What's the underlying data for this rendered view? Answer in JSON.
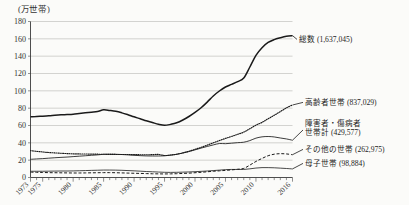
{
  "chart_data": {
    "type": "line",
    "title": "",
    "ylabel": "(万世帯)",
    "xlabel": "",
    "ylim": [
      0,
      180
    ],
    "yticks": [
      0,
      20,
      40,
      60,
      80,
      100,
      120,
      140,
      160,
      180
    ],
    "grid": true,
    "legend_position": "right-inline",
    "xlim": [
      1973,
      2016
    ],
    "xticks": [
      "1973",
      "1975",
      "1980",
      "1985",
      "1990",
      "1995",
      "2000",
      "2005",
      "2010",
      "2016"
    ],
    "xtick_values": [
      1973,
      1975,
      1980,
      1985,
      1990,
      1995,
      2000,
      2005,
      2010,
      2016
    ],
    "x": [
      1973,
      1974,
      1975,
      1976,
      1977,
      1978,
      1979,
      1980,
      1981,
      1982,
      1983,
      1984,
      1985,
      1986,
      1987,
      1988,
      1989,
      1990,
      1991,
      1992,
      1993,
      1994,
      1995,
      1996,
      1997,
      1998,
      1999,
      2000,
      2001,
      2002,
      2003,
      2004,
      2005,
      2006,
      2007,
      2008,
      2009,
      2010,
      2011,
      2012,
      2013,
      2014,
      2015,
      2016
    ],
    "series": [
      {
        "name": "総数",
        "label": "総数 (1,637,045)",
        "value_label": "1,637,045",
        "style": "solid-thick",
        "values": [
          70.0,
          70.5,
          70.8,
          71.2,
          71.8,
          72.3,
          72.6,
          73.0,
          73.8,
          74.6,
          75.4,
          76.2,
          78.1,
          77.4,
          76.4,
          74.6,
          72.4,
          70.0,
          67.8,
          65.4,
          63.4,
          61.4,
          60.2,
          61.3,
          63.1,
          66.3,
          70.4,
          75.1,
          80.5,
          87.0,
          94.1,
          99.8,
          104.4,
          107.5,
          110.6,
          114.8,
          127.5,
          141.0,
          149.8,
          155.8,
          159.1,
          161.2,
          162.9,
          163.7
        ],
        "end_value": 163.7
      },
      {
        "name": "高齢者世帯",
        "label": "高齢者世帯 (837,029)",
        "value_label": "837,029",
        "style": "dotted",
        "values": [
          31.0,
          30.2,
          29.5,
          28.8,
          28.4,
          28.0,
          27.6,
          27.3,
          27.2,
          27.1,
          27.0,
          26.9,
          26.8,
          26.7,
          26.6,
          26.5,
          26.5,
          26.4,
          26.3,
          26.2,
          26.4,
          26.6,
          25.4,
          25.9,
          26.8,
          28.4,
          30.3,
          32.5,
          34.8,
          37.3,
          40.0,
          42.6,
          45.1,
          47.4,
          49.8,
          52.4,
          56.3,
          60.4,
          63.6,
          67.8,
          71.8,
          76.1,
          80.3,
          83.7
        ],
        "end_value": 83.7
      },
      {
        "name": "障害者・傷病者世帯計",
        "label": "障害者・傷病者世帯計 (429,577)",
        "label_line1": "障害者・傷病者",
        "label_line2": "世帯計 (429,577)",
        "value_label": "429,577",
        "style": "solid-thin",
        "values": [
          21.0,
          21.4,
          21.8,
          22.3,
          22.8,
          23.2,
          23.6,
          24.1,
          24.6,
          25.1,
          25.6,
          26.1,
          26.8,
          26.9,
          26.8,
          26.5,
          26.1,
          25.6,
          25.2,
          24.9,
          24.8,
          24.8,
          25.0,
          25.8,
          26.8,
          28.2,
          29.9,
          31.9,
          33.9,
          35.8,
          37.6,
          39.2,
          39.0,
          39.6,
          40.2,
          40.7,
          42.6,
          45.4,
          46.9,
          47.3,
          46.8,
          45.6,
          44.5,
          43.0
        ],
        "end_value": 43.0
      },
      {
        "name": "その他の世帯",
        "label": "その他の世帯 (262,975)",
        "value_label": "262,975",
        "style": "dashed",
        "values": [
          6.2,
          6.0,
          5.8,
          5.6,
          5.5,
          5.4,
          5.3,
          5.2,
          5.2,
          5.3,
          5.4,
          5.5,
          5.6,
          5.6,
          5.5,
          5.3,
          5.1,
          4.9,
          4.7,
          4.5,
          4.3,
          4.2,
          4.1,
          4.2,
          4.4,
          4.7,
          5.0,
          5.5,
          6.0,
          6.6,
          7.2,
          7.7,
          8.2,
          8.8,
          9.5,
          10.5,
          14.3,
          18.5,
          22.0,
          25.1,
          26.9,
          27.5,
          27.2,
          26.3
        ],
        "end_value": 26.3
      },
      {
        "name": "母子世帯",
        "label": "母子世帯 (98,884)",
        "value_label": "98,884",
        "style": "solid-thin",
        "values": [
          7.2,
          7.2,
          7.2,
          7.3,
          7.4,
          7.5,
          7.5,
          7.6,
          7.8,
          8.0,
          8.2,
          8.4,
          8.6,
          8.6,
          8.5,
          8.3,
          8.0,
          7.7,
          7.3,
          6.9,
          6.6,
          6.3,
          6.0,
          5.9,
          6.0,
          6.2,
          6.4,
          6.7,
          7.1,
          7.5,
          8.0,
          8.5,
          9.1,
          9.3,
          9.3,
          9.3,
          10.0,
          10.9,
          11.4,
          11.4,
          11.2,
          10.8,
          10.4,
          9.9
        ],
        "end_value": 9.9
      }
    ]
  }
}
